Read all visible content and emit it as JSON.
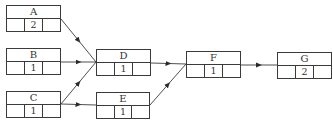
{
  "diagram": {
    "type": "activity-network",
    "nodes": [
      {
        "id": "A",
        "label": "A",
        "duration": "2",
        "x": 6,
        "y": 5,
        "w": 55,
        "h": 27
      },
      {
        "id": "B",
        "label": "B",
        "duration": "1",
        "x": 6,
        "y": 48,
        "w": 55,
        "h": 27
      },
      {
        "id": "C",
        "label": "C",
        "duration": "1",
        "x": 6,
        "y": 91,
        "w": 55,
        "h": 27
      },
      {
        "id": "D",
        "label": "D",
        "duration": "1",
        "x": 96,
        "y": 49,
        "w": 55,
        "h": 27
      },
      {
        "id": "E",
        "label": "E",
        "duration": "1",
        "x": 96,
        "y": 92,
        "w": 54,
        "h": 27
      },
      {
        "id": "F",
        "label": "F",
        "duration": "1",
        "x": 186,
        "y": 51,
        "w": 55,
        "h": 27
      },
      {
        "id": "G",
        "label": "G",
        "duration": "2",
        "x": 277,
        "y": 52,
        "w": 55,
        "h": 27
      }
    ],
    "edges": [
      {
        "from": "A",
        "to": "D",
        "x1": 61,
        "y1": 19,
        "x2": 96,
        "y2": 62
      },
      {
        "from": "B",
        "to": "D",
        "x1": 61,
        "y1": 62,
        "x2": 96,
        "y2": 62
      },
      {
        "from": "C",
        "to": "D",
        "x1": 61,
        "y1": 104,
        "x2": 96,
        "y2": 62
      },
      {
        "from": "C",
        "to": "E",
        "x1": 61,
        "y1": 104,
        "x2": 96,
        "y2": 105
      },
      {
        "from": "D",
        "to": "F",
        "x1": 151,
        "y1": 63,
        "x2": 186,
        "y2": 64
      },
      {
        "from": "E",
        "to": "F",
        "x1": 150,
        "y1": 105,
        "x2": 186,
        "y2": 64
      },
      {
        "from": "F",
        "to": "G",
        "x1": 241,
        "y1": 65,
        "x2": 277,
        "y2": 65
      }
    ],
    "colors": {
      "line": "#3a3a3a",
      "text": "#333333",
      "background": "#ffffff"
    }
  }
}
